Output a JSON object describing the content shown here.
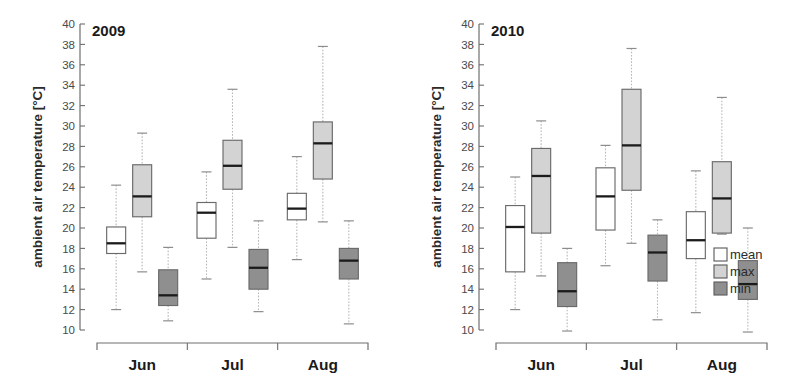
{
  "figure": {
    "ylabel": "ambient air temperature [°C]",
    "ytick_labels": [
      "40",
      "38",
      "36",
      "34",
      "32",
      "30",
      "28",
      "26",
      "24",
      "22",
      "20",
      "18",
      "16",
      "14",
      "12",
      "10"
    ],
    "legend_title": "",
    "legend": [
      {
        "label": "mean",
        "color": "#ffffff"
      },
      {
        "label": "max",
        "color": "#d3d3d3"
      },
      {
        "label": "min",
        "color": "#8f8f8f"
      }
    ]
  },
  "colors": {
    "mean_fill": "#ffffff",
    "max_fill": "#d3d3d3",
    "min_fill": "#8f8f8f",
    "box_stroke": "#6a6a6a",
    "median": "#1b1b1b",
    "whisker": "#b8b8b8",
    "axis": "#6e6e6e",
    "text": "#1a1a1a"
  },
  "chart_data": {
    "type": "box",
    "title": "",
    "xlabel": "",
    "ylabel": "ambient air temperature [°C]",
    "ylim": [
      10,
      40
    ],
    "ytick_step": 2,
    "grid": false,
    "legend_position": "right",
    "categories": [
      "Jun",
      "Jul",
      "Aug"
    ],
    "series_names": [
      "mean",
      "max",
      "min"
    ],
    "panels": [
      {
        "title": "2009",
        "groups": [
          {
            "category": "Jun",
            "boxes": [
              {
                "series": "mean",
                "whisker_low": 12.0,
                "q1": 17.5,
                "median": 18.5,
                "q3": 20.1,
                "whisker_high": 24.2
              },
              {
                "series": "max",
                "whisker_low": 15.7,
                "q1": 21.1,
                "median": 23.1,
                "q3": 26.2,
                "whisker_high": 29.3
              },
              {
                "series": "min",
                "whisker_low": 10.9,
                "q1": 12.4,
                "median": 13.4,
                "q3": 15.9,
                "whisker_high": 18.1
              }
            ]
          },
          {
            "category": "Jul",
            "boxes": [
              {
                "series": "mean",
                "whisker_low": 15.0,
                "q1": 19.0,
                "median": 21.5,
                "q3": 22.5,
                "whisker_high": 25.5
              },
              {
                "series": "max",
                "whisker_low": 18.1,
                "q1": 23.8,
                "median": 26.1,
                "q3": 28.6,
                "whisker_high": 33.6
              },
              {
                "series": "min",
                "whisker_low": 11.8,
                "q1": 14.0,
                "median": 16.1,
                "q3": 17.9,
                "whisker_high": 20.7
              }
            ]
          },
          {
            "category": "Aug",
            "boxes": [
              {
                "series": "mean",
                "whisker_low": 16.9,
                "q1": 20.8,
                "median": 21.9,
                "q3": 23.4,
                "whisker_high": 27.0
              },
              {
                "series": "max",
                "whisker_low": 20.6,
                "q1": 24.8,
                "median": 28.3,
                "q3": 30.4,
                "whisker_high": 37.8
              },
              {
                "series": "min",
                "whisker_low": 10.6,
                "q1": 15.0,
                "median": 16.8,
                "q3": 18.0,
                "whisker_high": 20.7
              }
            ]
          }
        ]
      },
      {
        "title": "2010",
        "groups": [
          {
            "category": "Jun",
            "boxes": [
              {
                "series": "mean",
                "whisker_low": 12.0,
                "q1": 15.7,
                "median": 20.1,
                "q3": 22.2,
                "whisker_high": 25.0
              },
              {
                "series": "max",
                "whisker_low": 15.3,
                "q1": 19.5,
                "median": 25.1,
                "q3": 27.8,
                "whisker_high": 30.5
              },
              {
                "series": "min",
                "whisker_low": 9.9,
                "q1": 12.3,
                "median": 13.8,
                "q3": 16.6,
                "whisker_high": 18.0
              }
            ]
          },
          {
            "category": "Jul",
            "boxes": [
              {
                "series": "mean",
                "whisker_low": 16.3,
                "q1": 19.8,
                "median": 23.1,
                "q3": 25.9,
                "whisker_high": 28.1
              },
              {
                "series": "max",
                "whisker_low": 18.5,
                "q1": 23.7,
                "median": 28.1,
                "q3": 33.6,
                "whisker_high": 37.6
              },
              {
                "series": "min",
                "whisker_low": 11.0,
                "q1": 14.8,
                "median": 17.6,
                "q3": 19.3,
                "whisker_high": 20.8
              }
            ]
          },
          {
            "category": "Aug",
            "boxes": [
              {
                "series": "mean",
                "whisker_low": 11.7,
                "q1": 17.0,
                "median": 18.8,
                "q3": 21.6,
                "whisker_high": 25.6
              },
              {
                "series": "max",
                "whisker_low": 19.4,
                "q1": 19.5,
                "median": 22.9,
                "q3": 26.5,
                "whisker_high": 32.8
              },
              {
                "series": "min",
                "whisker_low": 9.8,
                "q1": 13.0,
                "median": 14.5,
                "q3": 16.8,
                "whisker_high": 20.0
              }
            ]
          }
        ]
      }
    ]
  }
}
